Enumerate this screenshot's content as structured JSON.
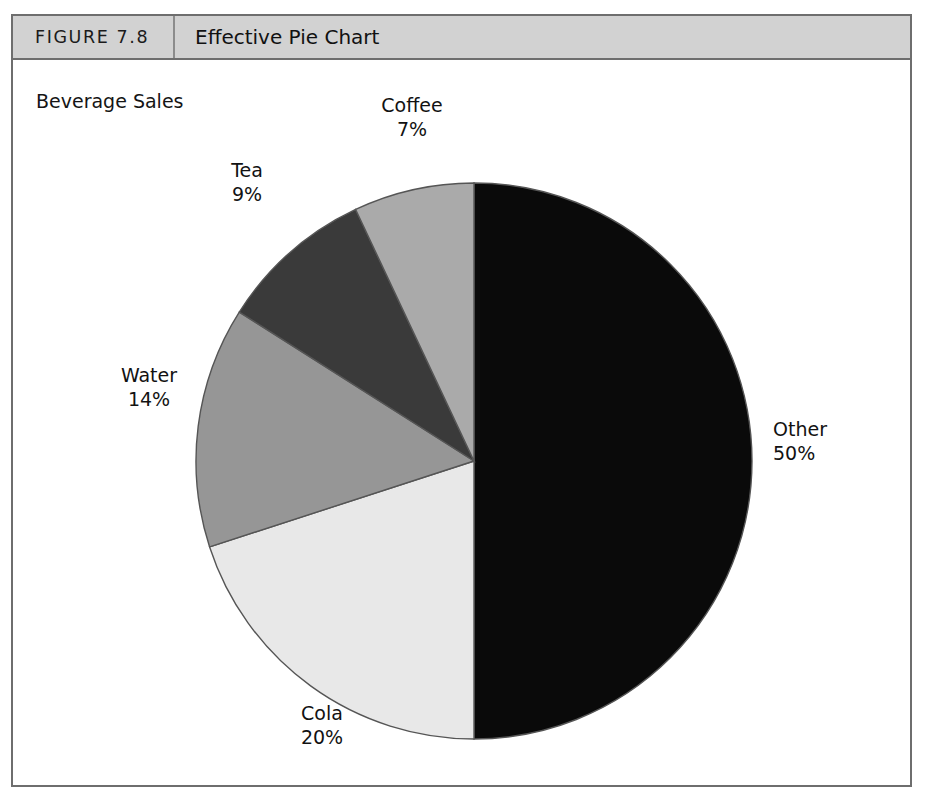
{
  "figure": {
    "number_label": "FIGURE 7.8",
    "title": "Effective Pie Chart"
  },
  "chart_data": {
    "type": "pie",
    "title": "Beverage Sales",
    "xlabel": "",
    "ylabel": "",
    "categories": [
      "Other",
      "Cola",
      "Water",
      "Tea",
      "Coffee"
    ],
    "values": [
      50,
      20,
      14,
      9,
      7
    ],
    "unit": "%",
    "start_angle_deg": 0,
    "direction": "clockwise",
    "legend": "none",
    "grid": false,
    "slices": [
      {
        "name": "Other",
        "value": 50,
        "value_label": "50%",
        "color": "#0a0a0a",
        "label_position": "right"
      },
      {
        "name": "Cola",
        "value": 20,
        "value_label": "20%",
        "color": "#e8e8e8",
        "label_position": "bottom"
      },
      {
        "name": "Water",
        "value": 14,
        "value_label": "14%",
        "color": "#969696",
        "label_position": "left"
      },
      {
        "name": "Tea",
        "value": 9,
        "value_label": "9%",
        "color": "#3a3a3a",
        "label_position": "upper-left"
      },
      {
        "name": "Coffee",
        "value": 7,
        "value_label": "7%",
        "color": "#aaaaaa",
        "label_position": "top"
      }
    ]
  },
  "colors": {
    "frame_border": "#6e6e6e",
    "header_background": "#d2d2d2",
    "page_background": "#ffffff",
    "text": "#121212",
    "slice_outline": "#555555"
  },
  "geometry": {
    "center_x": 461,
    "center_y": 401,
    "radius": 278
  }
}
